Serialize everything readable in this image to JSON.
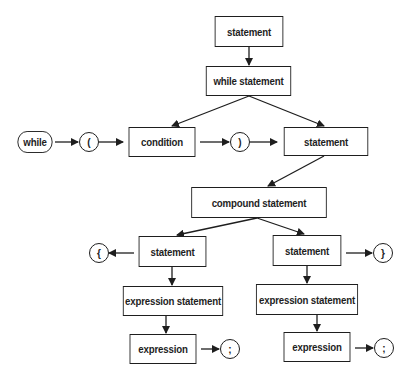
{
  "diagram": {
    "type": "syntax-diagram",
    "nodes": {
      "statement_top": "statement",
      "while_statement": "while statement",
      "while_keyword": "while",
      "open_paren": "(",
      "condition": "condition",
      "close_paren": ")",
      "statement_body": "statement",
      "compound_statement": "compound statement",
      "statement_left": "statement",
      "open_brace": "{",
      "expression_statement_left": "expression statement",
      "expression_left": "expression",
      "semicolon_left": ";",
      "statement_right": "statement",
      "close_brace": "}",
      "expression_statement_right": "expression statement",
      "expression_right": "expression",
      "semicolon_right": ";"
    },
    "edges": [
      [
        "statement_top",
        "while_statement"
      ],
      [
        "while_statement",
        "condition"
      ],
      [
        "while_statement",
        "statement_body"
      ],
      [
        "while_keyword",
        "open_paren"
      ],
      [
        "open_paren",
        "condition"
      ],
      [
        "condition",
        "close_paren"
      ],
      [
        "close_paren",
        "statement_body"
      ],
      [
        "statement_body",
        "compound_statement"
      ],
      [
        "compound_statement",
        "statement_left"
      ],
      [
        "compound_statement",
        "statement_right"
      ],
      [
        "statement_left",
        "open_brace"
      ],
      [
        "statement_left",
        "expression_statement_left"
      ],
      [
        "expression_statement_left",
        "expression_left"
      ],
      [
        "expression_left",
        "semicolon_left"
      ],
      [
        "statement_right",
        "close_brace"
      ],
      [
        "statement_right",
        "expression_statement_right"
      ],
      [
        "expression_statement_right",
        "expression_right"
      ],
      [
        "expression_right",
        "semicolon_right"
      ]
    ],
    "colors": {
      "stroke": "#1e1e1e",
      "fill": "#ffffff"
    }
  }
}
